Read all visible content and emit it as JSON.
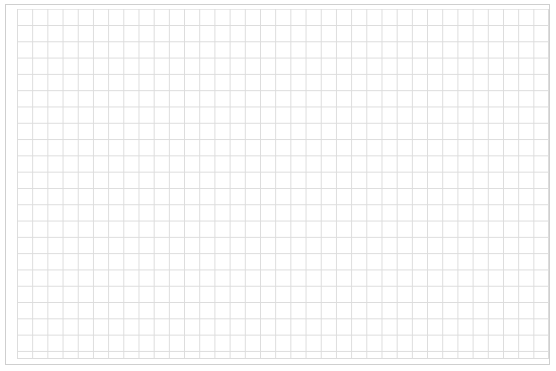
{
  "canvas": {
    "type": "blank-grid",
    "columns": 35,
    "rows": 21,
    "line_color": "#dcdcdc",
    "frame_color": "#cfcfcf",
    "background": "#ffffff"
  }
}
